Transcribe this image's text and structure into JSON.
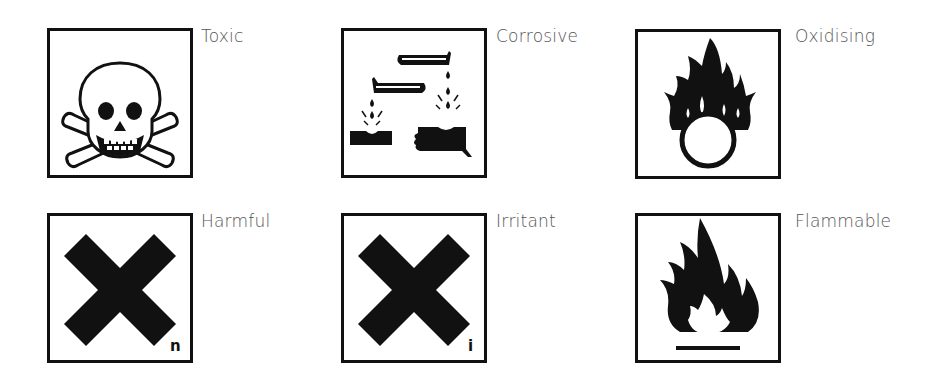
{
  "symbols": [
    {
      "id": "toxic",
      "label": "Toxic",
      "icon": "skull-crossbones-icon"
    },
    {
      "id": "corrosive",
      "label": "Corrosive",
      "icon": "corrosive-icon"
    },
    {
      "id": "oxidising",
      "label": "Oxidising",
      "icon": "flame-over-circle-icon"
    },
    {
      "id": "harmful",
      "label": "Harmful",
      "icon": "x-cross-icon",
      "sub_letter": "n"
    },
    {
      "id": "irritant",
      "label": "Irritant",
      "icon": "x-cross-icon",
      "sub_letter": "i"
    },
    {
      "id": "flammable",
      "label": "Flammable",
      "icon": "flame-icon"
    }
  ],
  "colors": {
    "ink": "#111111",
    "label": "#555555",
    "background": "#ffffff"
  }
}
